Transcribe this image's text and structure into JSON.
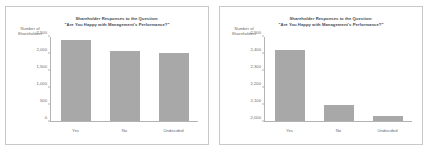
{
  "chart_data": [
    {
      "panel_id": "left-full-axis",
      "type": "bar",
      "title": "Shareholder Responses to the Question:",
      "title_line2": "\"Are You Happy with Management's Performance?\"",
      "ylabel_line1": "Number of",
      "ylabel_line2": "Shareholders",
      "xlabel": "",
      "categories": [
        "Yes",
        "No",
        "Undecided"
      ],
      "values": [
        2420,
        2095,
        2030
      ],
      "ylim": [
        0,
        2500
      ],
      "yticks": [
        0,
        500,
        1000,
        1500,
        2000,
        2500
      ],
      "ytick_labels": [
        "0",
        "500",
        "1,000",
        "1,500",
        "2,000",
        "2,500"
      ],
      "grid": false,
      "legend": "none",
      "bar_color": "#a8a8a8"
    },
    {
      "panel_id": "right-truncated-axis",
      "type": "bar",
      "title": "Shareholder Responses to the Question:",
      "title_line2": "\"Are You Happy with Management's Performance?\"",
      "ylabel_line1": "Number of",
      "ylabel_line2": "Shareholders",
      "xlabel": "",
      "categories": [
        "Yes",
        "No",
        "Undecided"
      ],
      "values": [
        2420,
        2095,
        2030
      ],
      "ylim": [
        2000,
        2500
      ],
      "yticks": [
        2000,
        2100,
        2200,
        2300,
        2400,
        2500
      ],
      "ytick_labels": [
        "2,000",
        "2,100",
        "2,200",
        "2,300",
        "2,400",
        "2,500"
      ],
      "grid": false,
      "legend": "none",
      "bar_color": "#a8a8a8"
    }
  ],
  "colors": {
    "bar": "#a8a8a8",
    "axis": "#b3b3b3",
    "text": "#6a6a6a",
    "title_text": "#4a4a4a",
    "panel_border": "#c9c9c9",
    "background": "#ffffff"
  }
}
